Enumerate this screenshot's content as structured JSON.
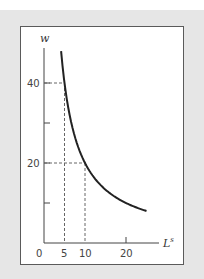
{
  "chart_data": {
    "type": "line",
    "title": "",
    "xlabel": "L",
    "xlabel_superscript": "s",
    "ylabel": "w",
    "x_ticks": [
      0,
      5,
      10,
      20
    ],
    "x_tick_labels": [
      "0",
      "5",
      "10",
      "20"
    ],
    "y_ticks": [
      10,
      20,
      30,
      40
    ],
    "y_tick_labels": [
      "",
      "20",
      "",
      "40"
    ],
    "xlim": [
      0,
      27
    ],
    "ylim": [
      0,
      48
    ],
    "grid": false,
    "series": [
      {
        "name": "labor supply curve",
        "function": "w = 200 / L",
        "x": [
          4.17,
          5,
          6,
          8,
          10,
          12,
          15,
          18,
          20,
          22,
          25
        ],
        "y": [
          48,
          40,
          33.3,
          25,
          20,
          16.7,
          13.3,
          11.1,
          10,
          9.1,
          8
        ]
      }
    ],
    "reference_points": [
      {
        "x": 5,
        "y": 40,
        "style": "dashed"
      },
      {
        "x": 10,
        "y": 20,
        "style": "dashed"
      }
    ],
    "colors": {
      "curve": "#222222",
      "axes": "#444444",
      "dashes": "#666666",
      "panel": "#e6e6e6"
    }
  }
}
